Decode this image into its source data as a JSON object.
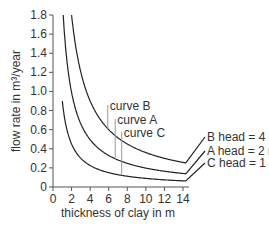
{
  "chart_data": {
    "type": "line",
    "title": "",
    "xlabel": "thickness of clay in m",
    "ylabel": "flow rate in m³/year",
    "xlim": [
      0,
      14
    ],
    "ylim": [
      0,
      1.8
    ],
    "grid": false,
    "legend_position": "right-inline",
    "x_ticks": [
      "0",
      "2",
      "4",
      "6",
      "8",
      "10",
      "12",
      "14"
    ],
    "y_ticks": [
      "0",
      "0.2",
      "0.4",
      "0.6",
      "0.8",
      "1.0",
      "1.2",
      "1.4",
      "1.6",
      "1.8"
    ],
    "series": [
      {
        "name": "B head = 4 m",
        "curve": "curve B",
        "x": [
          2.0,
          3,
          4,
          5,
          6,
          7,
          8,
          10,
          12,
          14
        ],
        "values": [
          1.8,
          1.2,
          0.9,
          0.72,
          0.6,
          0.51,
          0.45,
          0.36,
          0.3,
          0.26
        ]
      },
      {
        "name": "A head = 2 m",
        "curve": "curve A",
        "x": [
          1.1,
          2,
          3,
          4,
          5,
          6,
          7,
          8,
          10,
          12,
          14
        ],
        "values": [
          1.8,
          1.0,
          0.67,
          0.5,
          0.4,
          0.33,
          0.29,
          0.25,
          0.2,
          0.17,
          0.14
        ]
      },
      {
        "name": "C head = 1 m",
        "curve": "curve C",
        "x": [
          1.0,
          2,
          3,
          4,
          5,
          6,
          7,
          8,
          10,
          12,
          14
        ],
        "values": [
          0.9,
          0.45,
          0.3,
          0.23,
          0.18,
          0.15,
          0.13,
          0.11,
          0.09,
          0.075,
          0.065
        ]
      }
    ],
    "annotations": [
      {
        "text": "curve B",
        "x": 5.9
      },
      {
        "text": "curve A",
        "x": 6.7
      },
      {
        "text": "curve C",
        "x": 7.4
      }
    ]
  }
}
